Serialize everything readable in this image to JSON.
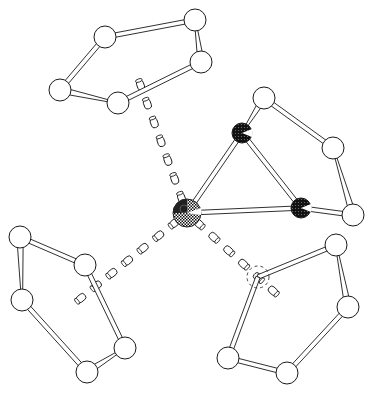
{
  "diagram": {
    "type": "ball-and-stick molecular structure",
    "colors": {
      "background": "#ffffff",
      "outline": "#1a1a1a",
      "ring_atom_fill": "#ffffff",
      "dark_atom_fill": "#111111",
      "metal_fill": "#222222"
    },
    "atoms": [
      {
        "id": "M1",
        "kind": "metal"
      },
      {
        "id": "D1",
        "kind": "dark"
      },
      {
        "id": "D2",
        "kind": "dark"
      },
      {
        "id": "A1",
        "kind": "ring",
        "ring": "top"
      },
      {
        "id": "A2",
        "kind": "ring",
        "ring": "top"
      },
      {
        "id": "A3",
        "kind": "ring",
        "ring": "top"
      },
      {
        "id": "A4",
        "kind": "ring",
        "ring": "top"
      },
      {
        "id": "A5",
        "kind": "ring",
        "ring": "top"
      },
      {
        "id": "B1",
        "kind": "ring",
        "ring": "right"
      },
      {
        "id": "B2",
        "kind": "ring",
        "ring": "right"
      },
      {
        "id": "B3",
        "kind": "ring",
        "ring": "right"
      },
      {
        "id": "C1",
        "kind": "ring",
        "ring": "left"
      },
      {
        "id": "C2",
        "kind": "ring",
        "ring": "left"
      },
      {
        "id": "C3",
        "kind": "ring",
        "ring": "left"
      },
      {
        "id": "C4",
        "kind": "ring",
        "ring": "left"
      },
      {
        "id": "C5",
        "kind": "ring",
        "ring": "left"
      },
      {
        "id": "E1",
        "kind": "ring-hidden",
        "ring": "bottom-right"
      },
      {
        "id": "E2",
        "kind": "ring",
        "ring": "bottom-right"
      },
      {
        "id": "E3",
        "kind": "ring",
        "ring": "bottom-right"
      },
      {
        "id": "E4",
        "kind": "ring",
        "ring": "bottom-right"
      },
      {
        "id": "E5",
        "kind": "ring",
        "ring": "bottom-right"
      }
    ],
    "bonds": [
      {
        "from": "A1",
        "to": "A2",
        "style": "solid"
      },
      {
        "from": "A2",
        "to": "A3",
        "style": "wedge"
      },
      {
        "from": "A3",
        "to": "A4",
        "style": "solid"
      },
      {
        "from": "A4",
        "to": "A5",
        "style": "wedge"
      },
      {
        "from": "A5",
        "to": "A1",
        "style": "solid"
      },
      {
        "from": "D1",
        "to": "B1",
        "style": "wedge"
      },
      {
        "from": "B1",
        "to": "B2",
        "style": "solid"
      },
      {
        "from": "B2",
        "to": "B3",
        "style": "wedge"
      },
      {
        "from": "B3",
        "to": "D2",
        "style": "solid"
      },
      {
        "from": "D1",
        "to": "D2",
        "style": "solid"
      },
      {
        "from": "M1",
        "to": "D1",
        "style": "solid"
      },
      {
        "from": "M1",
        "to": "D2",
        "style": "solid"
      },
      {
        "from": "C1",
        "to": "C2",
        "style": "solid"
      },
      {
        "from": "C2",
        "to": "C3",
        "style": "solid"
      },
      {
        "from": "C3",
        "to": "C4",
        "style": "wedge"
      },
      {
        "from": "C4",
        "to": "C5",
        "style": "solid"
      },
      {
        "from": "C5",
        "to": "C1",
        "style": "wedge"
      },
      {
        "from": "E1",
        "to": "E2",
        "style": "solid"
      },
      {
        "from": "E2",
        "to": "E3",
        "style": "wedge"
      },
      {
        "from": "E3",
        "to": "E4",
        "style": "solid"
      },
      {
        "from": "E4",
        "to": "E5",
        "style": "solid"
      },
      {
        "from": "E5",
        "to": "E1",
        "style": "solid"
      }
    ],
    "dashed_bonds": [
      {
        "from": "M1",
        "to": "top-centroid"
      },
      {
        "from": "M1",
        "to": "left-centroid"
      },
      {
        "from": "M1",
        "to": "bottom-right-centroid"
      }
    ]
  }
}
